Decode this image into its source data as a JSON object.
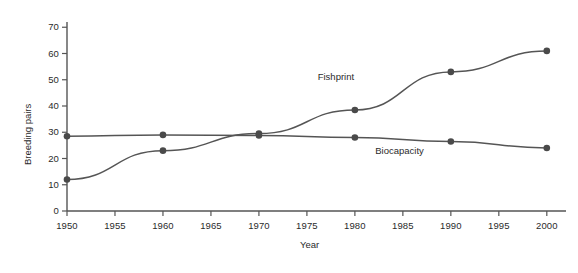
{
  "chart_data": {
    "type": "line",
    "title": "",
    "xlabel": "Year",
    "ylabel": "Breeding pairs",
    "x": [
      1950,
      1960,
      1970,
      1980,
      1990,
      2000
    ],
    "xlim": [
      1950,
      2002
    ],
    "ylim": [
      0,
      72
    ],
    "xticks": [
      1950,
      1955,
      1960,
      1965,
      1970,
      1975,
      1980,
      1985,
      1990,
      1995,
      2000
    ],
    "yticks": [
      0,
      10,
      20,
      30,
      40,
      50,
      60,
      70
    ],
    "grid": false,
    "legend": "inline-annotations",
    "series": [
      {
        "name": "Fishprint",
        "values": [
          12,
          23,
          29.5,
          38.5,
          53,
          61
        ],
        "color": "#555555",
        "marker": "circle"
      },
      {
        "name": "Biocapacity",
        "values": [
          28.5,
          29,
          28.8,
          28,
          26.5,
          24
        ],
        "color": "#555555",
        "marker": "circle"
      }
    ],
    "annotations": [
      {
        "text": "Fishprint",
        "x": 1978,
        "y": 51
      },
      {
        "text": "Biocapacity",
        "x": 1984,
        "y": 23
      }
    ]
  },
  "axes": {
    "x_tick_labels": [
      "1950",
      "1955",
      "1960",
      "1965",
      "1970",
      "1975",
      "1980",
      "1985",
      "1990",
      "1995",
      "2000"
    ],
    "y_tick_labels": [
      "0",
      "10",
      "20",
      "30",
      "40",
      "50",
      "60",
      "70"
    ],
    "x_title": "Year",
    "y_title": "Breeding pairs"
  },
  "colors": {
    "line": "#555555",
    "marker": "#4a4a4a",
    "axis": "#555555",
    "text": "#2b2b2b",
    "background": "#ffffff"
  }
}
